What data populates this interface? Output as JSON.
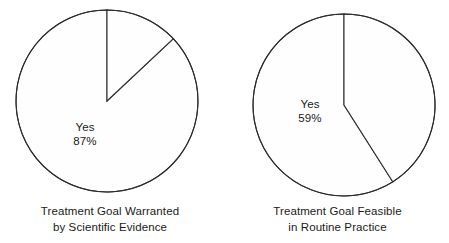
{
  "figure": {
    "background": "#ffffff",
    "line_color": "#2b2b2b",
    "text_color": "#1a1a1a"
  },
  "chart_data": [
    {
      "type": "pie",
      "id": "treatment-goal-warranted",
      "title": "Treatment Goal Warranted by Scientific Evidence",
      "title_line1": "Treatment Goal Warranted",
      "title_line2": "by Scientific Evidence",
      "categories": [
        "Yes",
        "No"
      ],
      "values": [
        87,
        13
      ],
      "unit": "%",
      "labels": [
        {
          "name": "Yes",
          "value": "87%",
          "shown": true
        },
        {
          "name": "No",
          "value": "13%",
          "shown": false
        }
      ],
      "start_angle_deg": 0,
      "direction": "clockwise",
      "legend": "none",
      "grid": false,
      "slice_fill": "#fefefe",
      "slice_stroke": "#2b2b2b"
    },
    {
      "type": "pie",
      "id": "treatment-goal-feasible",
      "title": "Treatment Goal Feasible in Routine Practice",
      "title_line1": "Treatment Goal Feasible",
      "title_line2": "in Routine Practice",
      "categories": [
        "Yes",
        "No"
      ],
      "values": [
        59,
        41
      ],
      "unit": "%",
      "labels": [
        {
          "name": "Yes",
          "value": "59%",
          "shown": true
        },
        {
          "name": "No",
          "value": "41%",
          "shown": false
        }
      ],
      "start_angle_deg": 0,
      "direction": "clockwise",
      "legend": "none",
      "grid": false,
      "slice_fill": "#fefefe",
      "slice_stroke": "#2b2b2b"
    }
  ],
  "left_chart": {
    "slice_label_name": "Yes",
    "slice_label_value": "87%",
    "caption_line1": "Treatment Goal Warranted",
    "caption_line2": "by Scientific Evidence"
  },
  "right_chart": {
    "slice_label_name": "Yes",
    "slice_label_value": "59%",
    "caption_line1": "Treatment Goal Feasible",
    "caption_line2": "in Routine Practice"
  }
}
